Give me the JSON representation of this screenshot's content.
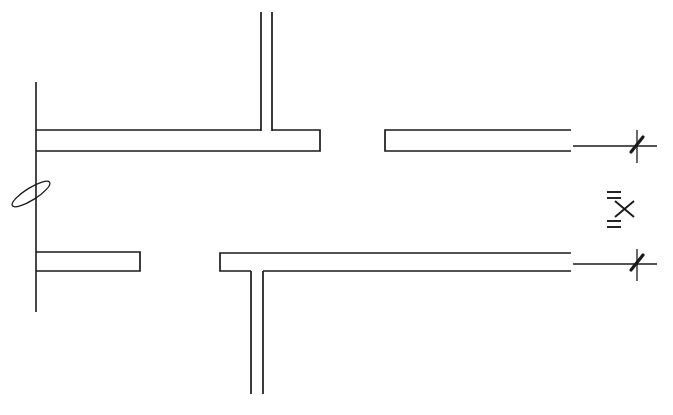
{
  "drawing": {
    "title": "Technical line drawing",
    "description": "Monochrome engineering-style line drawing of flange/web cross sections with dimension break symbols",
    "canvas": {
      "width": 673,
      "height": 415
    },
    "colors": {
      "background": "#ffffff",
      "ink": "#1a1a1a"
    },
    "elements": {
      "reference_line_label": "vertical reference line",
      "upper_left_flange_label": "upper left horizontal flange",
      "upper_stem_label": "upper vertical web stem",
      "upper_right_flange_label": "upper right horizontal flange",
      "lower_left_flange_label": "lower left short horizontal flange",
      "lower_tee_label": "lower inverted tee section",
      "lower_right_flange_label": "lower right horizontal flange",
      "slot_ellipse_label": "elongated slot break symbol",
      "upper_dimension_line_label": "upper dimension extension line",
      "lower_dimension_line_label": "lower dimension extension line",
      "break_symbol_label": "dimension break symbol"
    },
    "break_symbol": {
      "upper_equals": "=",
      "cross": "x",
      "lower_equals": "="
    },
    "geometry": {
      "vertical_reference": {
        "x": 36,
        "y_top": 82,
        "y_bottom": 312
      },
      "upper_flange": {
        "x_left": 36,
        "x_right": 320,
        "y_top": 130,
        "y_bottom": 151
      },
      "upper_stem": {
        "x_left": 261,
        "x_right": 272,
        "y_top": 12,
        "y_bottom": 131
      },
      "upper_right_flange": {
        "x_left": 385,
        "x_right": 571,
        "y_top": 130,
        "y_bottom": 151
      },
      "lower_left_flange": {
        "x_left": 36,
        "x_right": 140,
        "y_top": 252,
        "y_bottom": 271
      },
      "lower_tee_flange": {
        "x_left": 220,
        "x_right": 571,
        "y_top": 253,
        "y_bottom": 271
      },
      "lower_tee_stem": {
        "x_left": 251,
        "x_right": 263,
        "y_top": 271,
        "y_bottom": 394
      },
      "slot_ellipse": {
        "cx": 31,
        "cy": 194,
        "rx": 22,
        "ry": 6,
        "rotation_deg": -32
      },
      "upper_dim_line": {
        "y": 146,
        "x_start": 573,
        "x_end": 657
      },
      "lower_dim_line": {
        "y": 264,
        "x_start": 573,
        "x_end": 657
      },
      "upper_dim_tick": {
        "x": 637,
        "y_top": 130,
        "y_bottom": 163
      },
      "lower_dim_tick": {
        "x": 637,
        "y_top": 249,
        "y_bottom": 281
      },
      "break_cross": {
        "cx": 624,
        "cy": 208
      }
    }
  }
}
